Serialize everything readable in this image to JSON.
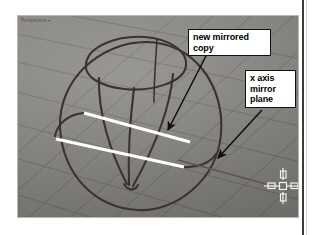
{
  "page": {
    "background_color": "#ffffff",
    "rule_color": "#3b3b3b"
  },
  "viewport": {
    "title": "Perspective",
    "title_caret": "▾",
    "background_color": "#8e8c88",
    "grid_color": "#6e6b66",
    "curve_color": "#3a3230",
    "selected_curve_color": "#ffffff",
    "name": "perspective-viewport"
  },
  "annotations": {
    "mirrored_copy": {
      "text": "new mirrored\ncopy",
      "arrow_from": [
        196,
        52
      ],
      "arrow_to": [
        163,
        124
      ]
    },
    "x_axis_plane": {
      "text": "x axis\nmirror\nplane",
      "arrow_from": [
        252,
        108
      ],
      "arrow_to": [
        213,
        154
      ]
    }
  },
  "cursor": {
    "name": "crosshair-cursor",
    "x": 264,
    "y": 170,
    "color": "#f2f0ec"
  },
  "scene": {
    "objects": [
      {
        "name": "original-curve",
        "type": "profile-curve",
        "color": "#ffffff",
        "selected": true
      },
      {
        "name": "mirrored-curve",
        "type": "profile-curve",
        "color": "#ffffff",
        "selected": true
      },
      {
        "name": "vase-surface-outline",
        "type": "revolved-surface",
        "color": "#3a3230",
        "selected": false
      },
      {
        "name": "sphere-outline",
        "type": "sphere-silhouette",
        "color": "#3a3230",
        "selected": false
      },
      {
        "name": "top-opening-ellipse",
        "type": "ellipse",
        "color": "#3a3230",
        "selected": false
      }
    ],
    "ground_plane": {
      "name": "construction-grid",
      "visible": true
    }
  }
}
